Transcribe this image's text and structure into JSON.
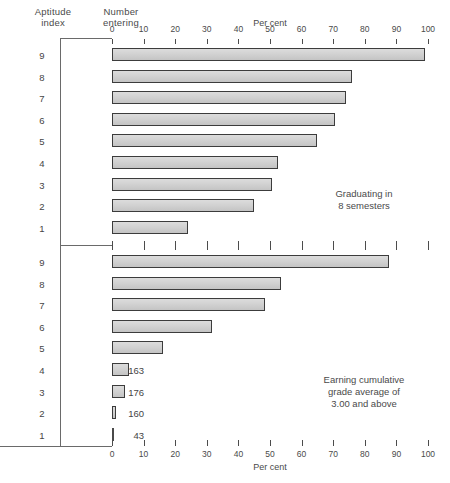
{
  "headers": {
    "aptitude": "Aptitude\nindex",
    "number": "Number\nentering"
  },
  "axis": {
    "title": "Per cent",
    "ticks": [
      0,
      10,
      20,
      30,
      40,
      50,
      60,
      70,
      80,
      90,
      100
    ],
    "min": 0,
    "max": 100
  },
  "annotations": {
    "top": "Graduating in\n8 semesters",
    "bottom": "Earning cumulative\ngrade average of\n3.00 and above"
  },
  "colors": {
    "bar_fill": "#d4d4d4",
    "bar_border": "#3c3c3c",
    "axis": "#4c4c4c",
    "text": "#454545",
    "background": "#ffffff"
  },
  "chart_data": {
    "type": "bar",
    "orientation": "horizontal",
    "title": "",
    "xlabel": "Per cent",
    "ylabel": "Aptitude index",
    "xlim": [
      0,
      100
    ],
    "grid": false,
    "legend": "none",
    "categories": [
      "9",
      "8",
      "7",
      "6",
      "5",
      "4",
      "3",
      "2",
      "1"
    ],
    "number_entering": [
      16,
      30,
      44,
      77,
      122,
      163,
      176,
      160,
      43
    ],
    "panels": [
      {
        "name": "graduating-in-8-semesters",
        "annotation": "Graduating in 8 semesters",
        "categories": [
          "9",
          "8",
          "7",
          "6",
          "5",
          "4",
          "3",
          "2",
          "1"
        ],
        "number_entering": [
          16,
          30,
          44,
          77,
          122,
          163,
          176,
          160,
          43
        ],
        "values": [
          99,
          76,
          74,
          70.5,
          65,
          52.5,
          50.5,
          45,
          24
        ]
      },
      {
        "name": "earning-cumulative-grade-average-3.00-and-above",
        "annotation": "Earning cumulative grade average of 3.00 and above",
        "categories": [
          "9",
          "8",
          "7",
          "6",
          "5",
          "4",
          "3",
          "2",
          "1"
        ],
        "number_entering": [
          16,
          30,
          44,
          77,
          122,
          163,
          176,
          160,
          43
        ],
        "values": [
          87.5,
          53.5,
          48.5,
          31.5,
          16,
          5.5,
          4,
          1.3,
          0
        ]
      }
    ]
  }
}
